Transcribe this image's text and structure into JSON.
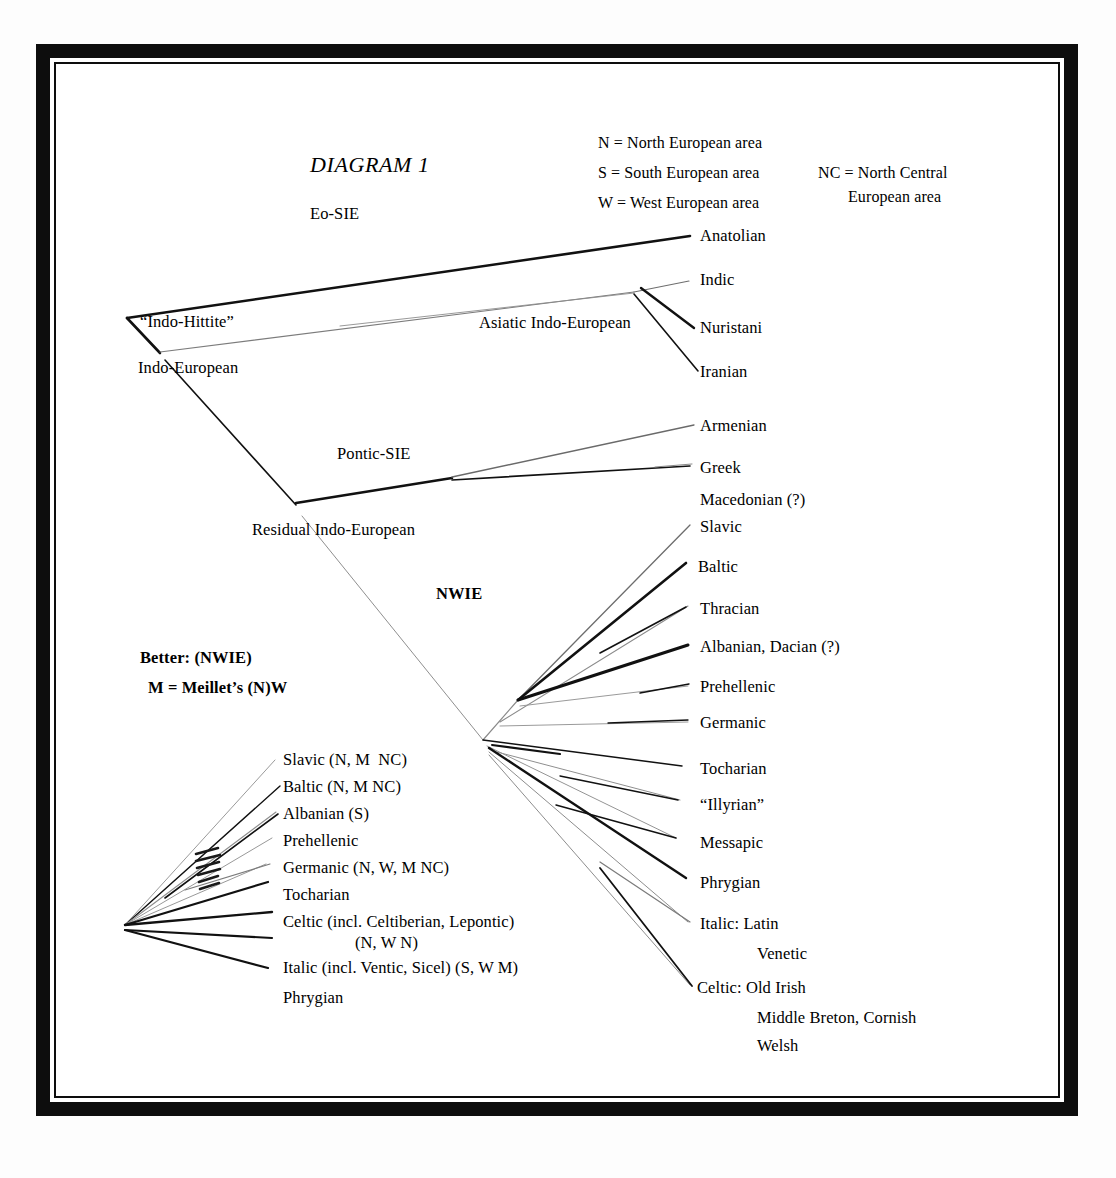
{
  "figure": {
    "title": "DIAGRAM 1"
  },
  "legend": {
    "left": [
      "N = North European area",
      "S = South European area",
      "W = West European area"
    ],
    "right": [
      "NC = North Central",
      "European area"
    ]
  },
  "notes": {
    "better": "Better: (NWIE)",
    "meillet": "M = Meillet’s (N)W"
  },
  "nodes": {
    "eo_sie": "Eo-SIE",
    "indo_hittite": "“Indo-Hittite”",
    "indo_european": "Indo-European",
    "asiatic_indo_european": "Asiatic Indo-European",
    "pontic_sie": "Pontic-SIE",
    "residual_indo_european": "Residual Indo-European",
    "nwie": "NWIE"
  },
  "branches": {
    "asiatic": [
      "Anatolian",
      "Indic",
      "Nuristani",
      "Iranian"
    ],
    "pontic": [
      "Armenian",
      "Greek",
      "Macedonian (?)"
    ],
    "nwie_right": [
      "Slavic",
      "Baltic",
      "Thracian",
      "Albanian, Dacian (?)",
      "Prehellenic",
      "Germanic",
      "Tocharian",
      "“Illyrian”",
      "Messapic",
      "Phrygian"
    ],
    "nwie_right_italic": [
      "Italic: Latin",
      "Venetic"
    ],
    "nwie_right_celtic": [
      "Celtic: Old Irish",
      "Middle Breton, Cornish",
      "Welsh"
    ],
    "nwie_left": [
      "Slavic (N, M  NC)",
      "Baltic (N, M NC)",
      "Albanian (S)",
      "Prehellenic",
      "Germanic (N, W, M NC)",
      "Tocharian",
      "Celtic (incl. Celtiberian, Lepontic)",
      "(N, W N)",
      "Italic (incl. Ventic, Sicel) (S, W M)",
      "Phrygian"
    ]
  },
  "colors": {
    "ink": "#0d0d0d",
    "paper": "#ffffff",
    "faint": "#5a5a5a"
  }
}
